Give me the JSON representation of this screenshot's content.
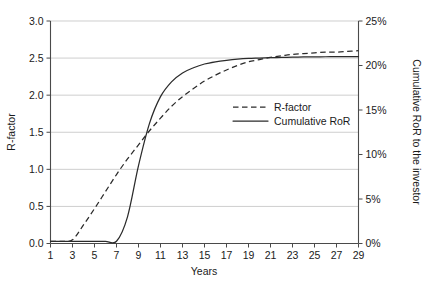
{
  "chart_data": {
    "type": "line",
    "title": "",
    "xlabel": "Years",
    "ylabel": "R-factor",
    "y2label": "Cumulative RoR to the investor",
    "grid": true,
    "legend_position": "center-right-inside",
    "xlim": [
      1,
      29
    ],
    "ylim": [
      0.0,
      3.0
    ],
    "y2lim": [
      0,
      25
    ],
    "x_ticks": [
      1,
      3,
      5,
      7,
      9,
      11,
      13,
      15,
      17,
      19,
      21,
      23,
      25,
      27,
      29
    ],
    "x_tick_labels": [
      "1",
      "3",
      "5",
      "7",
      "9",
      "11",
      "13",
      "15",
      "17",
      "19",
      "21",
      "23",
      "25",
      "27",
      "29"
    ],
    "y_ticks": [
      0.0,
      0.5,
      1.0,
      1.5,
      2.0,
      2.5,
      3.0
    ],
    "y_tick_labels": [
      "0.0",
      "0.5",
      "1.0",
      "1.5",
      "2.0",
      "2.5",
      "3.0"
    ],
    "y2_ticks": [
      0,
      5,
      10,
      15,
      20,
      25
    ],
    "y2_tick_labels": [
      "0%",
      "5%",
      "10%",
      "15%",
      "20%",
      "25%"
    ],
    "x": [
      1,
      2,
      3,
      4,
      5,
      6,
      7,
      8,
      9,
      10,
      11,
      12,
      13,
      14,
      15,
      16,
      17,
      18,
      19,
      20,
      21,
      22,
      23,
      24,
      25,
      26,
      27,
      28,
      29
    ],
    "series": [
      {
        "name": "R-factor",
        "style": "dashed",
        "axis": "left",
        "color": "#2b2b2b",
        "values": [
          0.03,
          0.03,
          0.05,
          0.25,
          0.47,
          0.7,
          0.93,
          1.14,
          1.33,
          1.52,
          1.69,
          1.85,
          1.98,
          2.09,
          2.19,
          2.27,
          2.34,
          2.4,
          2.45,
          2.48,
          2.51,
          2.53,
          2.55,
          2.56,
          2.57,
          2.58,
          2.58,
          2.59,
          2.6
        ]
      },
      {
        "name": "Cumulative RoR",
        "style": "solid",
        "axis": "left",
        "color": "#2b2b2b",
        "values": [
          0.03,
          0.03,
          0.03,
          0.03,
          0.03,
          0.03,
          0.03,
          0.36,
          1.05,
          1.62,
          1.98,
          2.18,
          2.3,
          2.37,
          2.42,
          2.45,
          2.47,
          2.485,
          2.495,
          2.5,
          2.505,
          2.51,
          2.512,
          2.515,
          2.517,
          2.518,
          2.519,
          2.52,
          2.52
        ]
      }
    ],
    "legend_entries": [
      {
        "label": "R-factor",
        "style": "dashed"
      },
      {
        "label": "Cumulative RoR",
        "style": "solid"
      }
    ]
  }
}
